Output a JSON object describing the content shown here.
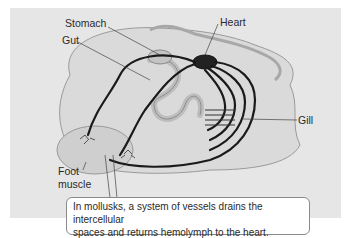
{
  "diagram": {
    "labels": {
      "stomach": "Stomach",
      "gut": "Gut",
      "heart": "Heart",
      "gill": "Gill",
      "foot_muscle_line1": "Foot",
      "foot_muscle_line2": "muscle"
    },
    "caption": {
      "line1": "In mollusks, a system of vessels drains the intercellular",
      "line2": "spaces and returns hemolymph to the heart."
    },
    "colors": {
      "panel_background": "#e6e6e6",
      "body_tissue": "#d4d4d4",
      "vessel": "#1a1a1a",
      "caption_border": "#8a8a8a"
    }
  }
}
